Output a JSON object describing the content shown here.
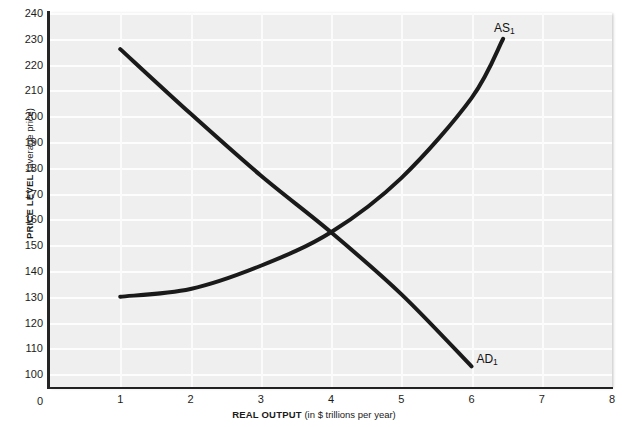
{
  "chart_data": {
    "type": "line",
    "title": "",
    "xlabel_strong": "REAL OUTPUT",
    "xlabel_soft": "(in $ trillions per year)",
    "ylabel_strong": "PRICE LEVEL",
    "ylabel_soft": "(average price)",
    "xlim": [
      0,
      8
    ],
    "ylim": [
      95,
      240
    ],
    "xticks": [
      0,
      1,
      2,
      3,
      4,
      5,
      6,
      7,
      8
    ],
    "xtick_labels": [
      "0",
      "1",
      "2",
      "3",
      "4",
      "5",
      "6",
      "7",
      "8"
    ],
    "yticks": [
      100,
      110,
      120,
      130,
      140,
      150,
      160,
      170,
      180,
      190,
      200,
      210,
      220,
      230,
      240
    ],
    "ytick_labels": [
      "100",
      "110",
      "120",
      "130",
      "140",
      "150",
      "160",
      "170",
      "180",
      "190",
      "200",
      "210",
      "220",
      "230",
      "240"
    ],
    "grid": true,
    "grid_color": "#ffffff",
    "plot_background": "#efefef",
    "legend": "none",
    "curve_color": "#1a1a1a",
    "equilibrium": {
      "x": 4.0,
      "y": 155
    },
    "series": [
      {
        "name": "AD1",
        "label": "AD",
        "label_subscript": "1",
        "label_x": 6.07,
        "label_y": 106,
        "kind": "demand",
        "points": [
          {
            "x": 1.0,
            "y": 226
          },
          {
            "x": 2.0,
            "y": 201
          },
          {
            "x": 3.0,
            "y": 177
          },
          {
            "x": 4.0,
            "y": 155
          },
          {
            "x": 5.0,
            "y": 131
          },
          {
            "x": 6.0,
            "y": 103
          }
        ]
      },
      {
        "name": "AS1",
        "label": "AS",
        "label_subscript": "1",
        "label_x": 6.32,
        "label_y": 234,
        "kind": "supply",
        "points": [
          {
            "x": 1.0,
            "y": 130
          },
          {
            "x": 2.0,
            "y": 133
          },
          {
            "x": 3.0,
            "y": 142
          },
          {
            "x": 4.0,
            "y": 155
          },
          {
            "x": 5.0,
            "y": 176
          },
          {
            "x": 6.0,
            "y": 207
          },
          {
            "x": 6.45,
            "y": 230
          }
        ]
      }
    ]
  }
}
